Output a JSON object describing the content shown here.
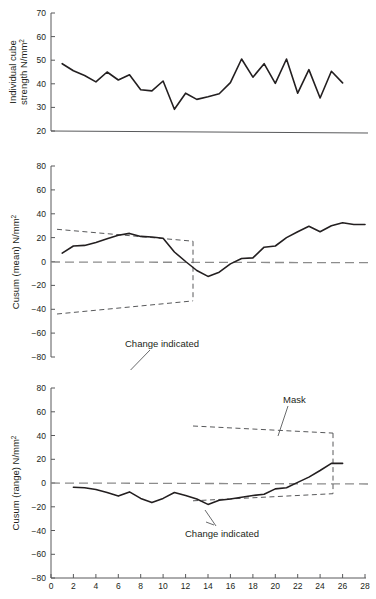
{
  "figure": {
    "background": "#ffffff",
    "line_color": "#231f20",
    "axis_color": "#58595b",
    "zero_line_color": "#8c8c8c"
  },
  "chart_data": [
    {
      "id": "individual-cube-strength",
      "type": "line",
      "title": "",
      "xlabel": "",
      "ylabel": "Individual cube strength N/mm",
      "ylabel_sup": "2",
      "ylim": [
        20,
        70
      ],
      "yticks": [
        20,
        30,
        40,
        50,
        60,
        70
      ],
      "ytick_labels": [
        "20",
        "30",
        "40",
        "50",
        "60",
        "70"
      ],
      "xlim": [
        0,
        28
      ],
      "grid": false,
      "legend": "none",
      "x": [
        1,
        2,
        3,
        4,
        5,
        6,
        7,
        8,
        9,
        10,
        11,
        12,
        13,
        14,
        15,
        16,
        17,
        18,
        19,
        20,
        21,
        22,
        23,
        24,
        25,
        26,
        27,
        28
      ],
      "values": [
        48.5,
        45.5,
        43.5,
        40.8,
        45.0,
        41.6,
        43.8,
        37.5,
        37.0,
        41.2,
        29.2,
        36.0,
        33.4,
        34.5,
        35.8,
        40.5,
        50.5,
        42.8,
        48.5,
        40.2,
        50.5,
        36.0,
        46.0,
        34.0,
        45.3,
        40.4
      ]
    },
    {
      "id": "cusum-mean",
      "type": "line",
      "title": "",
      "xlabel": "",
      "ylabel": "Cusum (mean) N/mm",
      "ylabel_sup": "2",
      "ylim": [
        -80,
        80
      ],
      "yticks": [
        -80,
        -60,
        -40,
        -20,
        0,
        20,
        40,
        60,
        80
      ],
      "ytick_labels": [
        "−80",
        "−60",
        "−40",
        "−20",
        "0",
        "20",
        "40",
        "60",
        "80"
      ],
      "xlim": [
        0,
        28
      ],
      "grid": false,
      "legend": "none",
      "zero_line": 0,
      "x": [
        1,
        2,
        3,
        4,
        5,
        6,
        7,
        8,
        9,
        10,
        11,
        12,
        13,
        14,
        15,
        16,
        17,
        18,
        19,
        20,
        21,
        22,
        23,
        24,
        25,
        26
      ],
      "values": [
        7,
        13,
        13.5,
        16,
        19,
        22,
        23.5,
        21,
        20.5,
        19.5,
        8,
        0,
        -7.5,
        -12.5,
        -9,
        -2,
        2.5,
        3,
        12,
        13,
        20,
        25,
        29.5,
        25,
        30,
        32.5,
        31,
        31
      ],
      "annotations": [
        {
          "name": "change-indicated",
          "text": "Change indicated",
          "x_px": 151,
          "y_px": 194
        },
        {
          "name": "mask",
          "text": "Mask",
          "x_px": 175,
          "y_px": 336
        }
      ],
      "mask": {
        "upper": [
          [
            57,
            27
          ],
          [
            193,
            17
          ]
        ],
        "lower": [
          [
            57,
            -44
          ],
          [
            193,
            -33
          ]
        ],
        "vertical_x": 193
      }
    },
    {
      "id": "cusum-range",
      "type": "line",
      "title": "",
      "xlabel": "",
      "ylabel": "Cusum (range) N/mm",
      "ylabel_sup": "2",
      "ylim": [
        -80,
        80
      ],
      "yticks": [
        -80,
        -60,
        -40,
        -20,
        0,
        20,
        40,
        60,
        80
      ],
      "ytick_labels": [
        "−80",
        "−60",
        "−40",
        "−20",
        "0",
        "20",
        "40",
        "60",
        "80"
      ],
      "xlim": [
        0,
        28
      ],
      "xticks": [
        0,
        2,
        4,
        6,
        8,
        10,
        12,
        14,
        16,
        18,
        20,
        22,
        24,
        26,
        28
      ],
      "xtick_labels": [
        "0",
        "2",
        "4",
        "6",
        "8",
        "10",
        "12",
        "14",
        "16",
        "18",
        "20",
        "22",
        "24",
        "26",
        "28"
      ],
      "grid": false,
      "legend": "none",
      "zero_line": 0,
      "x": [
        2,
        3,
        4,
        5,
        6,
        7,
        8,
        9,
        10,
        11,
        12,
        13,
        14,
        15,
        16,
        17,
        18,
        19,
        20,
        21,
        22,
        23,
        24,
        25,
        26
      ],
      "values": [
        -3.5,
        -4,
        -5.5,
        -8,
        -11,
        -7.5,
        -13,
        -16.5,
        -13,
        -8,
        -10.5,
        -13.5,
        -18,
        -14.5,
        -13.5,
        -12,
        -10.5,
        -9.5,
        -5,
        -4,
        0.5,
        5,
        10.5,
        16.5,
        16.5
      ],
      "annotations": [
        {
          "name": "mask",
          "text": "Mask",
          "x_px": 296,
          "y_px": 399
        },
        {
          "name": "change-indicated",
          "text": "Change indicated",
          "x_px": 220,
          "y_px": 533
        }
      ],
      "mask": {
        "upper": [
          [
            193,
            48
          ],
          [
            333,
            42
          ]
        ],
        "lower": [
          [
            193,
            -15
          ],
          [
            333,
            -9
          ]
        ],
        "vertical_x": 333
      }
    }
  ]
}
